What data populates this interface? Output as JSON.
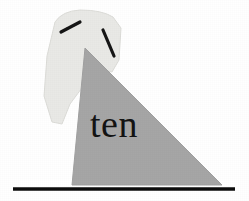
{
  "image": {
    "title": "ten",
    "background_color": "#ffffff",
    "width": 249,
    "height": 201
  },
  "artwork": {
    "hood_shape": {
      "name": "hood",
      "fill_color": "#e9e9e6",
      "stroke_color": "#dcdcd8",
      "path": "M 55 22 Q 62 11 80 10 Q 102 10 113 17 L 121 28 L 119 60 L 112 72 L 96 69 L 70 104 L 62 124 L 52 122 L 44 96 L 47 56 Z"
    },
    "triangle_shape": {
      "name": "triangle",
      "fill_color": "#a6a6a6",
      "stroke_color": "#a0a0a0",
      "path": "M 85 48 L 222 185 L 72 185 Z"
    },
    "mark_left": {
      "name": "mark-left",
      "color": "#151515",
      "x1": 61,
      "y1": 32,
      "x2": 80,
      "y2": 22,
      "width": 3.2
    },
    "mark_right": {
      "name": "mark-right",
      "color": "#151515",
      "x1": 103,
      "y1": 30,
      "x2": 114,
      "y2": 56,
      "width": 3.2
    },
    "baseline": {
      "name": "baseline",
      "color": "#0d0d0d",
      "x1": 13,
      "y1": 189,
      "x2": 235,
      "y2": 189,
      "width": 3.4
    },
    "word": {
      "text": "ten",
      "color": "#141414",
      "x": 90,
      "y": 137,
      "font_size": 38
    }
  }
}
